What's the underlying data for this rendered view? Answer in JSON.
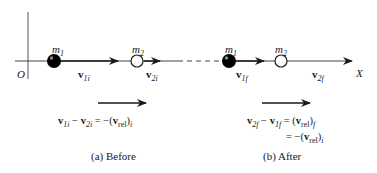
{
  "diagram": {
    "axis": {
      "origin_label": "O",
      "x_axis_label": "X"
    },
    "before": {
      "caption": "(a) Before",
      "mass1": {
        "label": "m",
        "sub": "1",
        "fill": "#000000"
      },
      "mass2": {
        "label": "m",
        "sub": "2",
        "fill": "#ffffff"
      },
      "v1_label": {
        "sym": "v",
        "sub": "1i"
      },
      "v2_label": {
        "sym": "v",
        "sub": "2i"
      },
      "equation": {
        "lhs_a": "v",
        "lhs_a_sub": "1i",
        "minus": "−",
        "lhs_b": "v",
        "lhs_b_sub": "2i",
        "equals": "=",
        "rhs_prefix": "−(",
        "rhs_sym": "v",
        "rhs_sub": "rel",
        "rhs_close": ")",
        "rhs_outer_sub": "i"
      }
    },
    "after": {
      "caption": "(b) After",
      "mass1": {
        "label": "m",
        "sub": "1",
        "fill": "#000000"
      },
      "mass2": {
        "label": "m",
        "sub": "2",
        "fill": "#ffffff"
      },
      "v1_label": {
        "sym": "v",
        "sub": "1f"
      },
      "v2_label": {
        "sym": "v",
        "sub": "2f"
      },
      "equation_line1": {
        "lhs_a": "v",
        "lhs_a_sub": "2f",
        "minus": "−",
        "lhs_b": "v",
        "lhs_b_sub": "1f",
        "equals": "=",
        "rhs_prefix": "(",
        "rhs_sym": "v",
        "rhs_sub": "rel",
        "rhs_close": ")",
        "rhs_outer_sub": "f"
      },
      "equation_line2": {
        "equals": "=",
        "rhs_prefix": "−(",
        "rhs_sym": "v",
        "rhs_sub": "rel",
        "rhs_close": ")",
        "rhs_outer_sub": "i"
      }
    }
  }
}
